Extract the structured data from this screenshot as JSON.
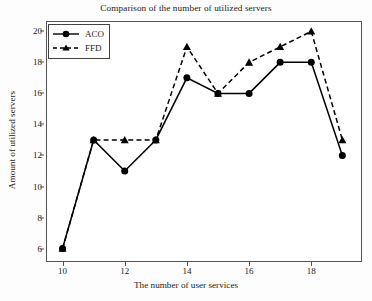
{
  "chart_data": {
    "type": "line",
    "title": "Comparison of the number of utilized servers",
    "xlabel": "The number of user services",
    "ylabel": "Amount of utilized servers",
    "x": [
      10,
      11,
      12,
      13,
      14,
      15,
      16,
      17,
      18,
      19
    ],
    "xlim": [
      9.5,
      19.6
    ],
    "ylim": [
      5.2,
      20.6
    ],
    "xticks": [
      10,
      12,
      14,
      16,
      18
    ],
    "yticks": [
      6,
      8,
      10,
      12,
      14,
      16,
      18,
      20
    ],
    "grid": false,
    "legend_position": "top-left",
    "series": [
      {
        "name": "ACO",
        "values": [
          6,
          13,
          11,
          13,
          17,
          16,
          16,
          18,
          18,
          12
        ],
        "line_style": "solid",
        "marker": "circle",
        "color": "#000000"
      },
      {
        "name": "FFD",
        "values": [
          6,
          13,
          13,
          13,
          19,
          16,
          18,
          19,
          20,
          13
        ],
        "line_style": "dashed",
        "marker": "triangle",
        "color": "#000000"
      }
    ]
  },
  "legend": {
    "items": [
      {
        "label": "ACO"
      },
      {
        "label": "FFD"
      }
    ]
  },
  "colors": {
    "axis": "#555555",
    "text": "#222222",
    "plot_background": "#ffffff",
    "figure_background": "#fdfdfd"
  }
}
